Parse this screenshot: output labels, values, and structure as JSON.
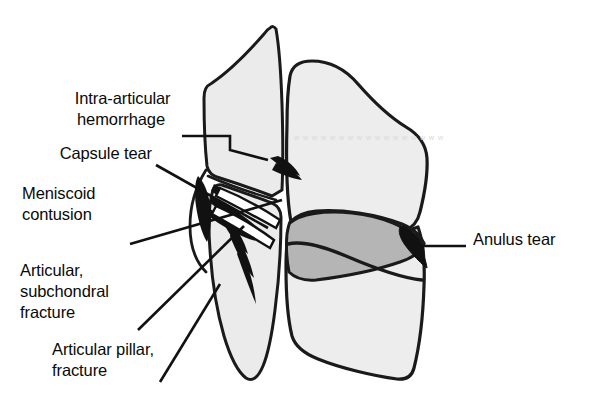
{
  "figure": {
    "kind": "anatomical-line-drawing",
    "background_color": "#ffffff",
    "ink_color": "#111111"
  },
  "palette": {
    "vertebral_body_fill": "#ededed",
    "articular_pillar_fill": "#ebebeb",
    "intervertebral_disc_fill": "#b5b5b5",
    "lesion_black": "#111111",
    "outline": "#1a1a1a",
    "paper": "#ffffff",
    "artifact_gray": "#d9d9d9"
  },
  "labels": [
    {
      "id": "intra-articular-hemorrhage",
      "lines": [
        "Intra-articular",
        "hemorrhage"
      ],
      "align": "right",
      "x": 175,
      "y": 104,
      "line_height": 21
    },
    {
      "id": "capsule-tear",
      "lines": [
        "Capsule tear"
      ],
      "align": "right",
      "x": 152,
      "y": 159,
      "line_height": 21
    },
    {
      "id": "meniscoid-contusion",
      "lines": [
        "Meniscoid",
        "contusion"
      ],
      "align": "left",
      "x": 22,
      "y": 199,
      "line_height": 21
    },
    {
      "id": "articular-subchondral-fracture",
      "lines": [
        "Articular,",
        "subchondral",
        "fracture"
      ],
      "align": "left",
      "x": 20,
      "y": 276,
      "line_height": 21
    },
    {
      "id": "articular-pillar-fracture",
      "lines": [
        "Articular pillar,",
        "fracture"
      ],
      "align": "left",
      "x": 52,
      "y": 355,
      "line_height": 21
    },
    {
      "id": "anulus-tear",
      "lines": [
        "Anulus tear"
      ],
      "align": "left",
      "x": 473,
      "y": 245,
      "line_height": 21
    }
  ],
  "structures": [
    {
      "id": "superior-articular-pillar",
      "name": "Superior articular pillar"
    },
    {
      "id": "inferior-articular-pillar",
      "name": "Inferior articular pillar"
    },
    {
      "id": "superior-vertebral-body",
      "name": "Superior vertebral body"
    },
    {
      "id": "inferior-vertebral-body",
      "name": "Inferior vertebral body"
    },
    {
      "id": "intervertebral-disc",
      "name": "Intervertebral disc"
    },
    {
      "id": "facet-joint-lesions",
      "name": "Facet joint lesion cluster"
    },
    {
      "id": "anulus-tear-lesion",
      "name": "Anulus tear lesion"
    }
  ],
  "artifact_text": "w w w w w w w w w w w w w w w w w"
}
